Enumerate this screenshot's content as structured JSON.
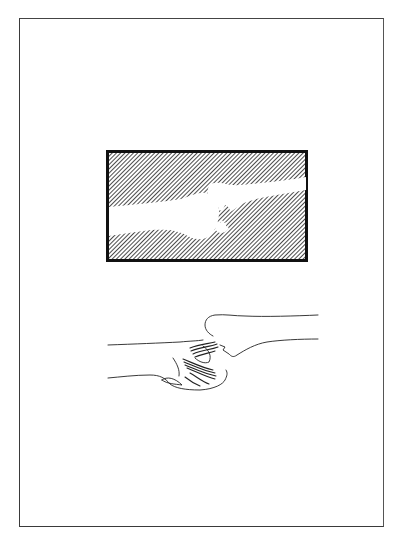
{
  "page": {
    "background": "#ffffff",
    "frame_color": "#3a3a3a"
  },
  "figures": [
    {
      "id": "xray-illustration",
      "description": "Hatched radiograph-style drawing of a dislocated joint with a small avulsed bone fragment",
      "hatch_color": "#2b2b2b",
      "border_color": "#111111"
    },
    {
      "id": "clinical-illustration",
      "description": "Line drawing of the corresponding limb showing deformity at the joint",
      "line_color": "#222222"
    }
  ]
}
